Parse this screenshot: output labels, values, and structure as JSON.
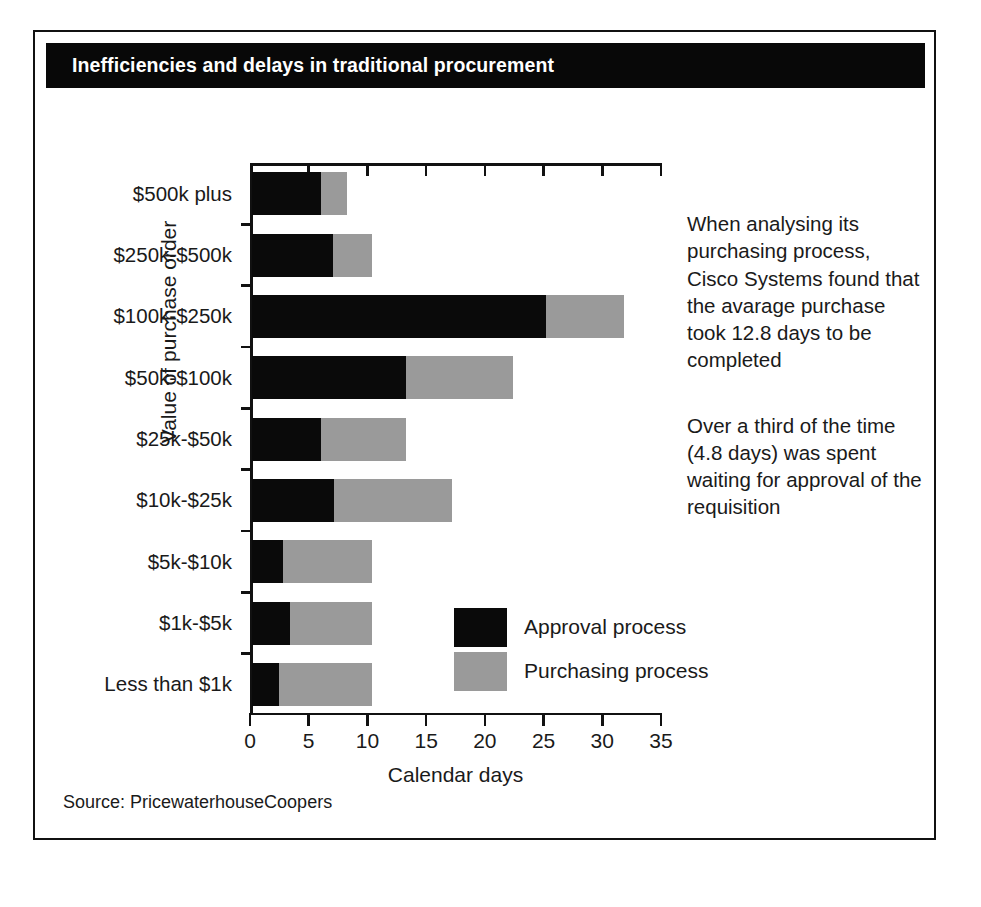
{
  "figure": {
    "title": "Inefficiencies and delays in traditional procurement",
    "source": "Source: PricewaterhouseCoopers"
  },
  "annotations": [
    "When analysing its purchasing process, Cisco Systems found that the avarage purchase took 12.8 days to be completed",
    "Over a third of the time (4.8 days) was spent waiting for approval of the requisition"
  ],
  "legend": [
    {
      "label": "Approval process",
      "color": "#0a0a0a"
    },
    {
      "label": "Purchasing process",
      "color": "#9a9a9a"
    }
  ],
  "chart_data": {
    "type": "bar",
    "orientation": "horizontal",
    "stacked": true,
    "title": "Inefficiencies and delays in traditional procurement",
    "xlabel": "Calendar days",
    "ylabel": "Value of purchase order",
    "xlim": [
      0,
      35
    ],
    "xticks": [
      0,
      5,
      10,
      15,
      20,
      25,
      30,
      35
    ],
    "xtick_labels": [
      "0",
      "5",
      "10",
      "15",
      "20",
      "25",
      "30",
      "35"
    ],
    "grid": false,
    "legend_position": "inside-bottom-center",
    "categories": [
      "$500k plus",
      "$250k-$500k",
      "$100k-$250k",
      "$50k-$100k",
      "$25k-$50k",
      "$10k-$25k",
      "$5k-$10k",
      "$1k-$5k",
      "Less than $1k"
    ],
    "series": [
      {
        "name": "Approval process",
        "color": "#0a0a0a",
        "values": [
          5.9,
          6.9,
          25.0,
          13.1,
          5.9,
          7.0,
          2.6,
          3.2,
          2.3
        ]
      },
      {
        "name": "Purchasing process",
        "color": "#9a9a9a",
        "values": [
          2.2,
          3.3,
          6.7,
          9.1,
          7.2,
          10.0,
          7.6,
          7.0,
          7.9
        ]
      }
    ],
    "totals": [
      8.1,
      10.2,
      31.7,
      22.2,
      13.1,
      17.0,
      10.2,
      10.2,
      10.2
    ]
  }
}
